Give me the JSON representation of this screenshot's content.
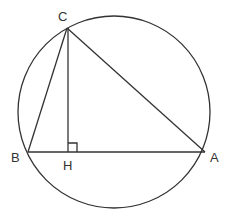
{
  "diagram": {
    "circle": {
      "cx": 114,
      "cy": 112,
      "r": 96
    },
    "points": {
      "A": {
        "label": "A",
        "x": 205,
        "y": 152
      },
      "B": {
        "label": "B",
        "x": 28,
        "y": 152
      },
      "C": {
        "label": "C",
        "x": 67,
        "y": 28
      },
      "H": {
        "label": "H",
        "x": 68,
        "y": 152
      }
    },
    "segments": [
      "AB",
      "BC",
      "CA",
      "CH"
    ],
    "right_angle_at": "H",
    "colors": {
      "stroke": "#333333",
      "background": "#ffffff"
    }
  }
}
